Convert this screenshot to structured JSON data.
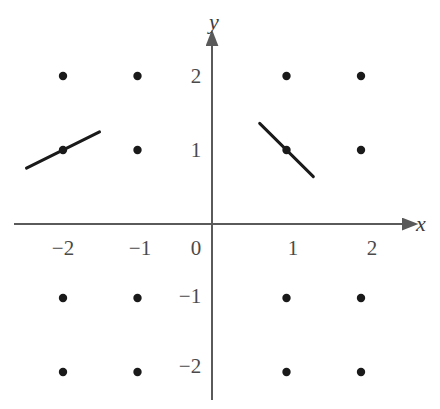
{
  "figure": {
    "kind": "slope-field-lattice",
    "background_color": "#ffffff",
    "axis_color": "#5a5a5a",
    "dot_color": "#1a1a1a",
    "segment_color": "#1a1a1a",
    "label_color": "#4a4a4a"
  },
  "chart_data": {
    "type": "scatter",
    "title": "",
    "xlabel": "x",
    "ylabel": "y",
    "grid": false,
    "legend": null,
    "xlim": [
      -2.85,
      2.75
    ],
    "ylim": [
      -2.6,
      2.6
    ],
    "xticks": [
      -2,
      -1,
      0,
      1,
      2
    ],
    "xtick_labels": [
      "−2",
      "−1",
      "0",
      "1",
      "2"
    ],
    "yticks": [
      -2,
      -1,
      1,
      2
    ],
    "ytick_labels": [
      "−2",
      "−1",
      "1",
      "2"
    ],
    "origin_label": "0",
    "points": [
      {
        "x": -2,
        "y": 2
      },
      {
        "x": -1,
        "y": 2
      },
      {
        "x": 1,
        "y": 2
      },
      {
        "x": 2,
        "y": 2
      },
      {
        "x": -2,
        "y": 1
      },
      {
        "x": -1,
        "y": 1
      },
      {
        "x": 1,
        "y": 1
      },
      {
        "x": 2,
        "y": 1
      },
      {
        "x": -2,
        "y": -1
      },
      {
        "x": -1,
        "y": -1
      },
      {
        "x": 1,
        "y": -1
      },
      {
        "x": 2,
        "y": -1
      },
      {
        "x": -2,
        "y": -2
      },
      {
        "x": -1,
        "y": -2
      },
      {
        "x": 1,
        "y": -2
      },
      {
        "x": 2,
        "y": -2
      }
    ],
    "segments": [
      {
        "name": "slope-segment-at-(-2,1)",
        "x": -2,
        "y": 1,
        "slope": 0.5,
        "half_length_x": 0.49
      },
      {
        "name": "slope-segment-at-(1,1)",
        "x": 1,
        "y": 1,
        "slope": -1.0,
        "half_length_x": 0.36
      }
    ],
    "axis_arrows": {
      "x": "right",
      "y": "up"
    }
  },
  "labels": {
    "x_axis_name": "x",
    "y_axis_name": "y",
    "x_neg2": "−2",
    "x_neg1": "−1",
    "x_zero": "0",
    "x_pos1": "1",
    "x_pos2": "2",
    "y_pos2": "2",
    "y_pos1": "1",
    "y_neg1": "−1",
    "y_neg2": "−2"
  }
}
